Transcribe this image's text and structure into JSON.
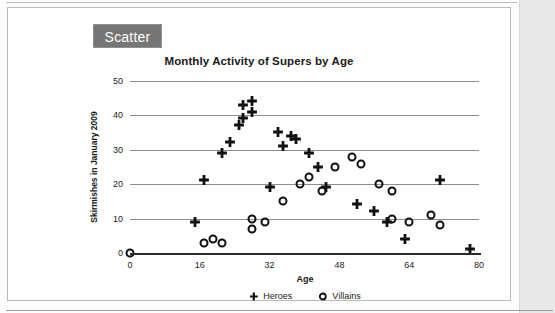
{
  "panel": {
    "tab_label": "Scatter"
  },
  "chart_data": {
    "type": "scatter",
    "title": "Monthly Activity of Supers by Age",
    "xlabel": "Age",
    "ylabel": "Skirmishes in January 2009",
    "xlim": [
      0,
      80
    ],
    "ylim": [
      0,
      50
    ],
    "xticks": [
      "0",
      "16",
      "32",
      "48",
      "64",
      "80"
    ],
    "xtick_values": [
      0,
      16,
      32,
      48,
      64,
      80
    ],
    "yticks": [
      "0",
      "10",
      "20",
      "30",
      "40",
      "50"
    ],
    "ytick_values": [
      0,
      10,
      20,
      30,
      40,
      50
    ],
    "grid": "horizontal",
    "legend_position": "bottom",
    "series": [
      {
        "name": "Heroes",
        "marker": "plus",
        "color": "#111111",
        "points": [
          [
            15,
            10
          ],
          [
            17,
            22
          ],
          [
            21,
            30
          ],
          [
            23,
            33
          ],
          [
            25,
            38
          ],
          [
            26,
            40
          ],
          [
            26,
            44
          ],
          [
            28,
            42
          ],
          [
            28,
            45
          ],
          [
            32,
            20
          ],
          [
            34,
            36
          ],
          [
            35,
            32
          ],
          [
            37,
            35
          ],
          [
            38,
            34
          ],
          [
            41,
            30
          ],
          [
            43,
            26
          ],
          [
            45,
            20
          ],
          [
            52,
            15
          ],
          [
            56,
            13
          ],
          [
            59,
            10
          ],
          [
            63,
            5
          ],
          [
            71,
            22
          ],
          [
            78,
            2
          ]
        ]
      },
      {
        "name": "Villains",
        "marker": "circle",
        "color": "#111111",
        "points": [
          [
            0,
            0
          ],
          [
            17,
            3
          ],
          [
            19,
            4
          ],
          [
            21,
            3
          ],
          [
            28,
            10
          ],
          [
            28,
            7
          ],
          [
            31,
            9
          ],
          [
            35,
            15
          ],
          [
            39,
            20
          ],
          [
            41,
            22
          ],
          [
            44,
            18
          ],
          [
            47,
            25
          ],
          [
            51,
            28
          ],
          [
            53,
            26
          ],
          [
            57,
            20
          ],
          [
            60,
            18
          ],
          [
            60,
            10
          ],
          [
            64,
            9
          ],
          [
            69,
            11
          ],
          [
            71,
            8
          ]
        ]
      }
    ]
  }
}
